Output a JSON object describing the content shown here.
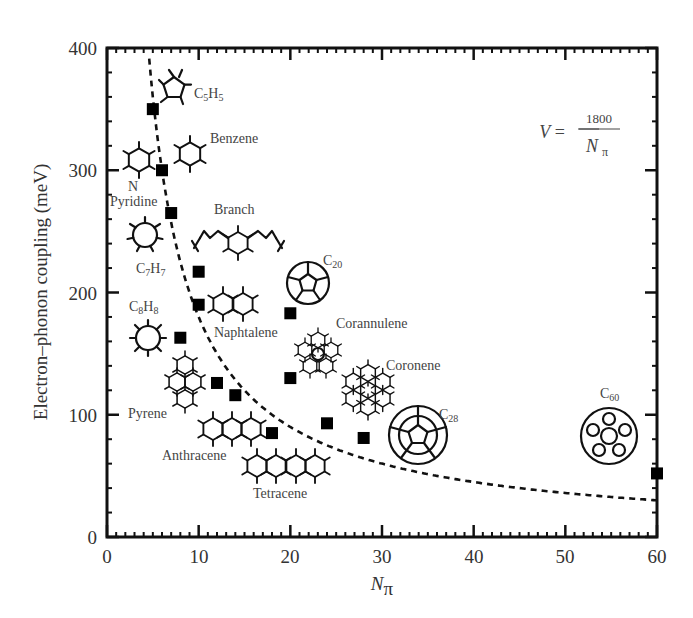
{
  "chart_data": {
    "type": "scatter",
    "title": "",
    "xlabel": "N_π",
    "ylabel": "Electron–phonon coupling (meV)",
    "xlim": [
      0,
      60
    ],
    "ylim": [
      0,
      400
    ],
    "x_ticks": [
      0,
      10,
      20,
      30,
      40,
      50,
      60
    ],
    "y_ticks": [
      0,
      100,
      200,
      300,
      400
    ],
    "grid": false,
    "legend": null,
    "series": [
      {
        "name": "Molecules",
        "marker": "filled-square",
        "points": [
          {
            "x": 5,
            "y": 350,
            "molecule": "C5H5"
          },
          {
            "x": 6,
            "y": 300,
            "molecule": "Benzene"
          },
          {
            "x": 6,
            "y": 300,
            "molecule": "Pyridine"
          },
          {
            "x": 7,
            "y": 265,
            "molecule": "C7H7"
          },
          {
            "x": 10,
            "y": 217,
            "molecule": "Branch"
          },
          {
            "x": 10,
            "y": 190,
            "molecule": "Naphtalene"
          },
          {
            "x": 8,
            "y": 163,
            "molecule": "C8H8"
          },
          {
            "x": 12,
            "y": 126,
            "molecule": "Pyrene"
          },
          {
            "x": 14,
            "y": 116,
            "molecule": "Anthracene"
          },
          {
            "x": 18,
            "y": 85,
            "molecule": "Tetracene"
          },
          {
            "x": 20,
            "y": 183,
            "molecule": "C20"
          },
          {
            "x": 20,
            "y": 130,
            "molecule": "Corannulene"
          },
          {
            "x": 24,
            "y": 93,
            "molecule": "Coronene"
          },
          {
            "x": 28,
            "y": 81,
            "molecule": "C28"
          },
          {
            "x": 60,
            "y": 52,
            "molecule": "C60"
          }
        ]
      },
      {
        "name": "Fit V = 1800/N_π",
        "style": "dashed",
        "function": "1800/x",
        "x_range": [
          4.6,
          60
        ]
      }
    ],
    "annotations": [
      {
        "text": "V = 1800 / N_π",
        "position": "upper-right"
      },
      {
        "text": "C5H5"
      },
      {
        "text": "Benzene"
      },
      {
        "text": "N"
      },
      {
        "text": "Pyridine"
      },
      {
        "text": "Branch"
      },
      {
        "text": "C7H7"
      },
      {
        "text": "C20"
      },
      {
        "text": "C8H8"
      },
      {
        "text": "Naphtalene"
      },
      {
        "text": "Corannulene"
      },
      {
        "text": "Coronene"
      },
      {
        "text": "Pyrene"
      },
      {
        "text": "Anthracene"
      },
      {
        "text": "C28"
      },
      {
        "text": "C60"
      },
      {
        "text": "Tetracene"
      }
    ]
  },
  "labels": {
    "ylabel": "Electron–phonon coupling (meV)",
    "xlabel_main": "N",
    "xlabel_sub": "π",
    "formula_lhs": "V =",
    "formula_num": "1800",
    "formula_den_main": "N",
    "formula_den_sub": "π",
    "c5h5": {
      "main": "C",
      "s1": "5",
      "m2": "H",
      "s2": "5"
    },
    "benzene": "Benzene",
    "n_atom": "N",
    "pyridine": "Pyridine",
    "branch": "Branch",
    "c7h7": {
      "main": "C",
      "s1": "7",
      "m2": "H",
      "s2": "7"
    },
    "c20": {
      "main": "C",
      "s1": "20"
    },
    "c8h8": {
      "main": "C",
      "s1": "8",
      "m2": "H",
      "s2": "8"
    },
    "naphtalene": "Naphtalene",
    "corannulene": "Corannulene",
    "coronene": "Coronene",
    "pyrene": "Pyrene",
    "anthracene": "Anthracene",
    "c28": {
      "main": "C",
      "s1": "28"
    },
    "c60": {
      "main": "C",
      "s1": "60"
    },
    "tetracene": "Tetracene"
  }
}
